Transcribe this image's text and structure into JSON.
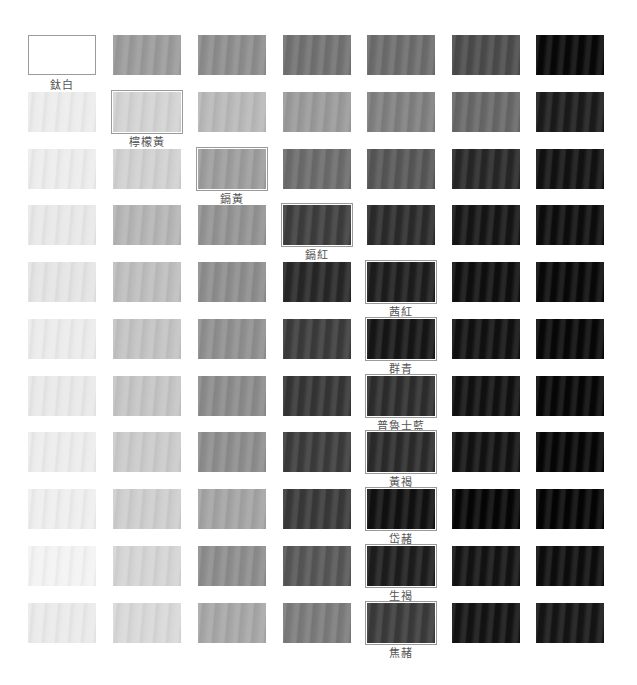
{
  "layout": {
    "columns_x": [
      28,
      113,
      198,
      283,
      367,
      452,
      536
    ],
    "rows_y": [
      35,
      92,
      149,
      205,
      262,
      319,
      376,
      432,
      489,
      546,
      603
    ],
    "swatch_w": 68,
    "swatch_h": 40
  },
  "rows": [
    {
      "colors": [
        "#ffffff",
        "#9a9a9a",
        "#8c8c8c",
        "#707070",
        "#6b6b6b",
        "#4a4a4a",
        "#070707"
      ],
      "selected": 0,
      "label": "鈦白"
    },
    {
      "colors": [
        "#ececec",
        "#d2d2d2",
        "#b8b8b8",
        "#999999",
        "#7e7e7e",
        "#666666",
        "#1a1a1a"
      ],
      "selected": 1,
      "label": "檸檬黃"
    },
    {
      "colors": [
        "#ececec",
        "#d0d0d0",
        "#9c9c9c",
        "#6a6a6a",
        "#555555",
        "#262626",
        "#111111"
      ],
      "selected": 2,
      "label": "鎘黃"
    },
    {
      "colors": [
        "#e8e8e8",
        "#b4b4b4",
        "#929292",
        "#3c3c3c",
        "#2a2a2a",
        "#141414",
        "#0c0c0c"
      ],
      "selected": 3,
      "label": "鎘紅"
    },
    {
      "colors": [
        "#e4e4e4",
        "#bdbdbd",
        "#8c8c8c",
        "#262626",
        "#1c1c1c",
        "#0e0e0e",
        "#080808"
      ],
      "selected": 4,
      "label": "茜紅"
    },
    {
      "colors": [
        "#ebebeb",
        "#c2c2c2",
        "#8e8e8e",
        "#3a3a3a",
        "#151515",
        "#101010",
        "#070707"
      ],
      "selected": 4,
      "label": "群青"
    },
    {
      "colors": [
        "#e9e9e9",
        "#c4c4c4",
        "#8a8a8a",
        "#343434",
        "#2c2c2c",
        "#101010",
        "#060606"
      ],
      "selected": 4,
      "label": "普魯士藍"
    },
    {
      "colors": [
        "#ececec",
        "#cacaca",
        "#8c8c8c",
        "#3a3a3a",
        "#2a2a2a",
        "#111111",
        "#050505"
      ],
      "selected": 4,
      "label": "黃褐"
    },
    {
      "colors": [
        "#eeeeee",
        "#cdcdcd",
        "#a3a3a3",
        "#383838",
        "#101010",
        "#050505",
        "#040404"
      ],
      "selected": 4,
      "label": "岱赭"
    },
    {
      "colors": [
        "#f3f3f3",
        "#d4d4d4",
        "#8c8c8c",
        "#555555",
        "#1c1c1c",
        "#121212",
        "#0c0c0c"
      ],
      "selected": 4,
      "label": "生褐"
    },
    {
      "colors": [
        "#eaeaea",
        "#d8d8d8",
        "#a6a6a6",
        "#7a7a7a",
        "#3a3a3a",
        "#121212",
        "#141414"
      ],
      "selected": 4,
      "label": "焦赭"
    }
  ]
}
